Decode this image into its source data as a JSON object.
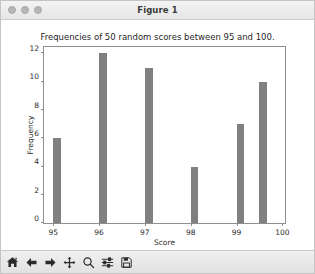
{
  "window": {
    "title": "Figure 1",
    "traffic_lights": [
      "close-dot",
      "minimize-dot",
      "zoom-dot"
    ]
  },
  "chart_data": {
    "type": "bar",
    "title": "Frequencies of 50 random scores between 95 and 100.",
    "xlabel": "Score",
    "ylabel": "Frequency",
    "x": [
      95,
      96,
      97,
      98,
      99,
      99.5
    ],
    "values": [
      6,
      12,
      11,
      4,
      7,
      10
    ],
    "bar_color": "#808080",
    "bar_width": 0.17,
    "bar_align": "edge",
    "xlim": [
      94.8,
      100.1
    ],
    "ylim": [
      0,
      12.6
    ],
    "xticks": [
      95,
      96,
      97,
      98,
      99,
      100
    ],
    "xticklabels": [
      "95",
      "96",
      "97",
      "98",
      "99",
      "100"
    ],
    "yticks": [
      0,
      2,
      4,
      6,
      8,
      10,
      12
    ],
    "yticklabels": [
      "0",
      "2",
      "4",
      "6",
      "8",
      "10",
      "12"
    ],
    "grid": false,
    "legend": null,
    "total_scores": 50
  },
  "toolbar": {
    "buttons": [
      {
        "name": "home-icon",
        "label": "Home"
      },
      {
        "name": "back-arrow-icon",
        "label": "Back"
      },
      {
        "name": "forward-arrow-icon",
        "label": "Forward"
      },
      {
        "name": "pan-move-icon",
        "label": "Pan"
      },
      {
        "name": "zoom-magnifier-icon",
        "label": "Zoom"
      },
      {
        "name": "configure-subplots-icon",
        "label": "Configure subplots"
      },
      {
        "name": "save-floppy-icon",
        "label": "Save"
      }
    ]
  }
}
